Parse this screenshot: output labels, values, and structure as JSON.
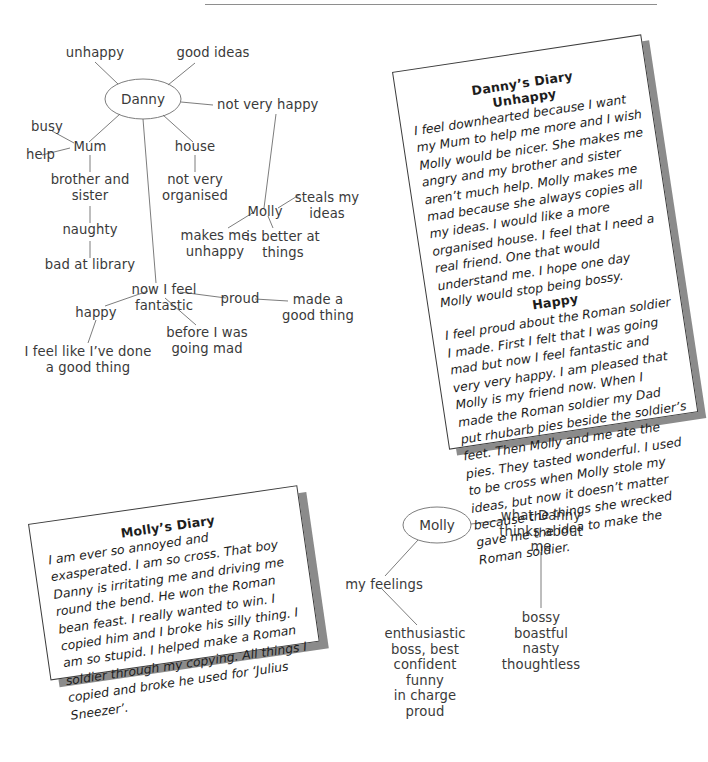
{
  "page": {
    "rule_color": "#8e8e8e",
    "ink_color": "#3a3a3a",
    "card_shadow_color": "#8b8b8b"
  },
  "mindmap_danny": {
    "center": "Danny",
    "nodes": {
      "unhappy": "unhappy",
      "good_ideas": "good ideas",
      "not_very_happy": "not very happy",
      "busy": "busy",
      "help": "help",
      "mum": "Mum",
      "brother_and_sister": "brother and\nsister",
      "naughty": "naughty",
      "bad_at_library": "bad at library",
      "house": "house",
      "not_very_organised": "not very\norganised",
      "molly": "Molly",
      "steals_my_ideas": "steals my\nideas",
      "is_better_at_things": "is better at\nthings",
      "makes_me_unhappy": "makes me\nunhappy",
      "now_i_feel_fantastic": "now I feel\nfantastic",
      "happy": "happy",
      "i_feel_like_done": "I feel like I’ve done\na good thing",
      "before_i_was_going_mad": "before I was\ngoing mad",
      "proud": "proud",
      "made_a_good_thing": "made a\ngood thing"
    }
  },
  "mindmap_molly": {
    "center": "Molly",
    "nodes": {
      "what_danny_thinks": "what Danny\nthinks about\nme",
      "bossy_list": "bossy\nboastful\nnasty\nthoughtless",
      "my_feelings": "my feelings",
      "feelings_list": "enthusiastic\nboss, best\nconfident\nfunny\nin charge\nproud"
    }
  },
  "dannys_diary": {
    "title": "Danny’s Diary",
    "section1_heading": "Unhappy",
    "section1_text": "I feel downhearted because I want my Mum to help me more and I wish Molly would be nicer. She makes me angry and my brother and sister aren’t much help. Molly makes me mad because she always copies all my ideas. I would like a more organised house. I feel that I need a real friend. One that would understand me. I hope one day Molly would stop being bossy.",
    "section2_heading": "Happy",
    "section2_text": "I feel proud about the Roman soldier I made. First I felt that I was going mad but now I feel fantastic and very very happy. I am pleased that Molly is my friend now. When I made the Roman soldier my Dad put rhubarb pies beside the soldier’s feet. Then Molly and me ate the pies. They tasted wonderful. I used to be cross when Molly stole my ideas, but now it doesn’t matter because the things she wrecked gave me the idea to make the Roman soldier."
  },
  "mollys_diary": {
    "title": "Molly’s Diary",
    "text": "I am ever so annoyed and exasperated. I am so cross. That boy Danny is irritating me and driving me round the bend. He won the Roman bean feast. I really wanted to win. I copied him and I broke his silly thing. I am so stupid. I helped make a Roman soldier through my copying. All things I copied and broke he used for ‘Julius Sneezer’."
  }
}
